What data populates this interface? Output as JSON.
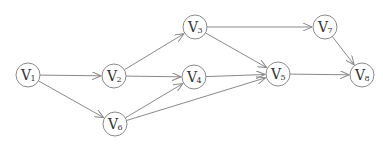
{
  "diagram": {
    "type": "directed-graph",
    "colors": {
      "stroke": "#8a8a8a",
      "text": "#333333",
      "background": "#ffffff"
    },
    "node_radius": 12,
    "nodes": [
      {
        "id": "v1",
        "letter": "V",
        "sub": "1",
        "x": 28,
        "y": 75
      },
      {
        "id": "v2",
        "letter": "V",
        "sub": "2",
        "x": 114,
        "y": 76
      },
      {
        "id": "v3",
        "letter": "V",
        "sub": "3",
        "x": 195,
        "y": 27
      },
      {
        "id": "v4",
        "letter": "V",
        "sub": "4",
        "x": 194,
        "y": 77
      },
      {
        "id": "v5",
        "letter": "V",
        "sub": "5",
        "x": 278,
        "y": 74
      },
      {
        "id": "v6",
        "letter": "V",
        "sub": "6",
        "x": 115,
        "y": 124
      },
      {
        "id": "v7",
        "letter": "V",
        "sub": "7",
        "x": 325,
        "y": 27
      },
      {
        "id": "v8",
        "letter": "V",
        "sub": "8",
        "x": 362,
        "y": 75
      }
    ],
    "edges": [
      {
        "from": "v1",
        "to": "v2"
      },
      {
        "from": "v1",
        "to": "v6"
      },
      {
        "from": "v2",
        "to": "v3"
      },
      {
        "from": "v2",
        "to": "v4"
      },
      {
        "from": "v6",
        "to": "v4"
      },
      {
        "from": "v6",
        "to": "v5"
      },
      {
        "from": "v3",
        "to": "v7"
      },
      {
        "from": "v3",
        "to": "v5"
      },
      {
        "from": "v4",
        "to": "v5"
      },
      {
        "from": "v5",
        "to": "v8"
      },
      {
        "from": "v7",
        "to": "v8"
      }
    ]
  }
}
